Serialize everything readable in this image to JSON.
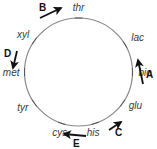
{
  "diagram": {
    "type": "circular-gene-map",
    "circle_color": "#8a8a8a",
    "arrow_color": "#111111",
    "genes": [
      {
        "name": "thr",
        "angle_deg": 90
      },
      {
        "name": "lac",
        "angle_deg": 30
      },
      {
        "name": "bio",
        "angle_deg": 0
      },
      {
        "name": "glu",
        "angle_deg": -35
      },
      {
        "name": "his",
        "angle_deg": -72
      },
      {
        "name": "cys",
        "angle_deg": -108
      },
      {
        "name": "tyr",
        "angle_deg": -145
      },
      {
        "name": "met",
        "angle_deg": 180
      },
      {
        "name": "xyl",
        "angle_deg": 145
      }
    ],
    "arrows": [
      {
        "label": "A",
        "direction": "up",
        "near": "lac"
      },
      {
        "label": "B",
        "direction": "up-right",
        "near": "thr"
      },
      {
        "label": "C",
        "direction": "up-right",
        "near": "glu"
      },
      {
        "label": "D",
        "direction": "down",
        "near": "met"
      },
      {
        "label": "E",
        "direction": "left",
        "near": "cys"
      }
    ]
  }
}
